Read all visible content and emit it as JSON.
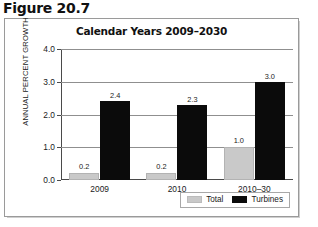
{
  "figure": {
    "label": "Figure 20.7"
  },
  "chart_data": {
    "type": "bar",
    "title": "Calendar Years 2009–2030",
    "xlabel": "",
    "ylabel": "ANNUAL PERCENT GROWTH",
    "ylim": [
      0.0,
      4.0
    ],
    "ytick_labels": [
      "0.0",
      "1.0",
      "2.0",
      "3.0",
      "4.0"
    ],
    "ytick_values": [
      0.0,
      1.0,
      2.0,
      3.0,
      4.0
    ],
    "grid": true,
    "legend_position": "bottom-right",
    "categories": [
      "2009",
      "2010",
      "2010–30"
    ],
    "series": [
      {
        "name": "Total",
        "color": "#c9c9c9",
        "values": [
          0.2,
          0.2,
          1.0
        ],
        "labels": [
          "0.2",
          "0.2",
          "1.0"
        ]
      },
      {
        "name": "Turbines",
        "color": "#0b0b0b",
        "values": [
          2.4,
          2.3,
          3.0
        ],
        "labels": [
          "2.4",
          "2.3",
          "3.0"
        ]
      }
    ]
  },
  "legend": {
    "items": [
      {
        "label": "Total",
        "swatch": "total-swatch"
      },
      {
        "label": "Turbines",
        "swatch": "turbines-swatch"
      }
    ]
  }
}
